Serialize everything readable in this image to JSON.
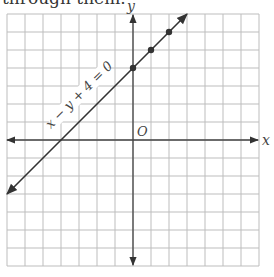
{
  "caption": "through them.",
  "chart_data": {
    "type": "line",
    "title": "",
    "xlabel": "x",
    "ylabel": "y",
    "origin_label": "O",
    "xlim": [
      -7,
      7
    ],
    "ylim": [
      -7,
      7
    ],
    "grid": true,
    "grid_step": 1,
    "series": [
      {
        "name": "x − y + 4 = 0",
        "equation": "y = x + 4",
        "x": [
          -7,
          3
        ],
        "y": [
          -3,
          7
        ],
        "arrows_both_ends": true
      }
    ],
    "points": [
      {
        "x": 0,
        "y": 4
      },
      {
        "x": 1,
        "y": 5
      },
      {
        "x": 2,
        "y": 6
      }
    ],
    "annotations": [
      {
        "text": "x − y + 4 = 0",
        "rotation_deg": -45,
        "along_line": true
      }
    ]
  }
}
